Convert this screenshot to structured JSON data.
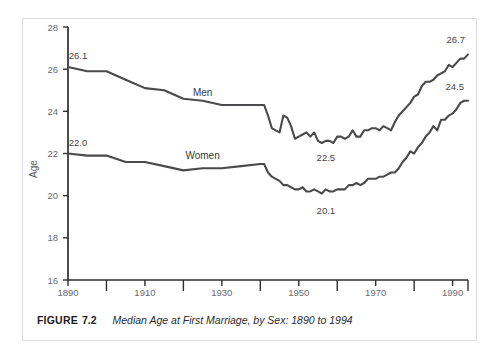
{
  "caption": {
    "label": "FIGURE",
    "number": "7.2",
    "text": "Median Age at First Marriage, by Sex: 1890 to 1994"
  },
  "chart_data": {
    "type": "line",
    "title": "Median Age at First Marriage, by Sex: 1890 to 1994",
    "xlabel": "",
    "ylabel": "Age",
    "xlim": [
      1890,
      1994
    ],
    "ylim": [
      16,
      28
    ],
    "yticks": [
      16,
      18,
      20,
      22,
      24,
      26,
      28
    ],
    "xticks": [
      1890,
      1900,
      1910,
      1920,
      1930,
      1940,
      1950,
      1960,
      1970,
      1980,
      1990,
      1994
    ],
    "xticks_upper_row": [
      1890,
      1910,
      1930,
      1950,
      1970,
      1990
    ],
    "xticks_lower_row": [
      1900,
      1920,
      1940,
      1960,
      1980,
      1994
    ],
    "grid": false,
    "legend": "inline-labels",
    "line_color": "#4a4a4c",
    "annotations": [
      {
        "text": "26.1",
        "series": "Men",
        "x": 1890,
        "y": 26.1
      },
      {
        "text": "22.5",
        "series": "Men",
        "x": 1956,
        "y": 22.5
      },
      {
        "text": "26.7",
        "series": "Men",
        "x": 1994,
        "y": 26.7
      },
      {
        "text": "22.0",
        "series": "Women",
        "x": 1890,
        "y": 22.0
      },
      {
        "text": "20.1",
        "series": "Women",
        "x": 1956,
        "y": 20.1
      },
      {
        "text": "24.5",
        "series": "Women",
        "x": 1994,
        "y": 24.5
      }
    ],
    "series": [
      {
        "name": "Men",
        "label": "Men",
        "x": [
          1890,
          1895,
          1900,
          1905,
          1910,
          1915,
          1920,
          1925,
          1930,
          1935,
          1940,
          1941,
          1942,
          1943,
          1944,
          1945,
          1946,
          1947,
          1948,
          1949,
          1950,
          1951,
          1952,
          1953,
          1954,
          1955,
          1956,
          1957,
          1958,
          1959,
          1960,
          1961,
          1962,
          1963,
          1964,
          1965,
          1966,
          1967,
          1968,
          1969,
          1970,
          1971,
          1972,
          1973,
          1974,
          1975,
          1976,
          1977,
          1978,
          1979,
          1980,
          1981,
          1982,
          1983,
          1984,
          1985,
          1986,
          1987,
          1988,
          1989,
          1990,
          1991,
          1992,
          1993,
          1994
        ],
        "values": [
          26.1,
          25.9,
          25.9,
          25.5,
          25.1,
          25.0,
          24.6,
          24.5,
          24.3,
          24.3,
          24.3,
          24.3,
          23.8,
          23.2,
          23.1,
          23.0,
          23.8,
          23.7,
          23.3,
          22.7,
          22.8,
          22.9,
          23.0,
          22.8,
          23.0,
          22.6,
          22.5,
          22.6,
          22.6,
          22.5,
          22.8,
          22.8,
          22.7,
          22.8,
          23.1,
          22.8,
          22.8,
          23.1,
          23.1,
          23.2,
          23.2,
          23.1,
          23.3,
          23.2,
          23.1,
          23.5,
          23.8,
          24.0,
          24.2,
          24.4,
          24.7,
          24.8,
          25.2,
          25.4,
          25.4,
          25.5,
          25.7,
          25.8,
          25.9,
          26.2,
          26.1,
          26.3,
          26.5,
          26.5,
          26.7
        ]
      },
      {
        "name": "Women",
        "label": "Women",
        "x": [
          1890,
          1895,
          1900,
          1905,
          1910,
          1915,
          1920,
          1925,
          1930,
          1935,
          1940,
          1941,
          1942,
          1943,
          1944,
          1945,
          1946,
          1947,
          1948,
          1949,
          1950,
          1951,
          1952,
          1953,
          1954,
          1955,
          1956,
          1957,
          1958,
          1959,
          1960,
          1961,
          1962,
          1963,
          1964,
          1965,
          1966,
          1967,
          1968,
          1969,
          1970,
          1971,
          1972,
          1973,
          1974,
          1975,
          1976,
          1977,
          1978,
          1979,
          1980,
          1981,
          1982,
          1983,
          1984,
          1985,
          1986,
          1987,
          1988,
          1989,
          1990,
          1991,
          1992,
          1993,
          1994
        ],
        "values": [
          22.0,
          21.9,
          21.9,
          21.6,
          21.6,
          21.4,
          21.2,
          21.3,
          21.3,
          21.4,
          21.5,
          21.5,
          21.1,
          20.9,
          20.8,
          20.7,
          20.5,
          20.5,
          20.4,
          20.3,
          20.3,
          20.4,
          20.2,
          20.2,
          20.3,
          20.2,
          20.1,
          20.3,
          20.2,
          20.2,
          20.3,
          20.3,
          20.3,
          20.5,
          20.5,
          20.6,
          20.5,
          20.6,
          20.8,
          20.8,
          20.8,
          20.9,
          20.9,
          21.0,
          21.1,
          21.1,
          21.3,
          21.6,
          21.8,
          22.1,
          22.0,
          22.3,
          22.5,
          22.8,
          23.0,
          23.3,
          23.1,
          23.6,
          23.6,
          23.8,
          23.9,
          24.1,
          24.4,
          24.5,
          24.5
        ]
      }
    ]
  }
}
